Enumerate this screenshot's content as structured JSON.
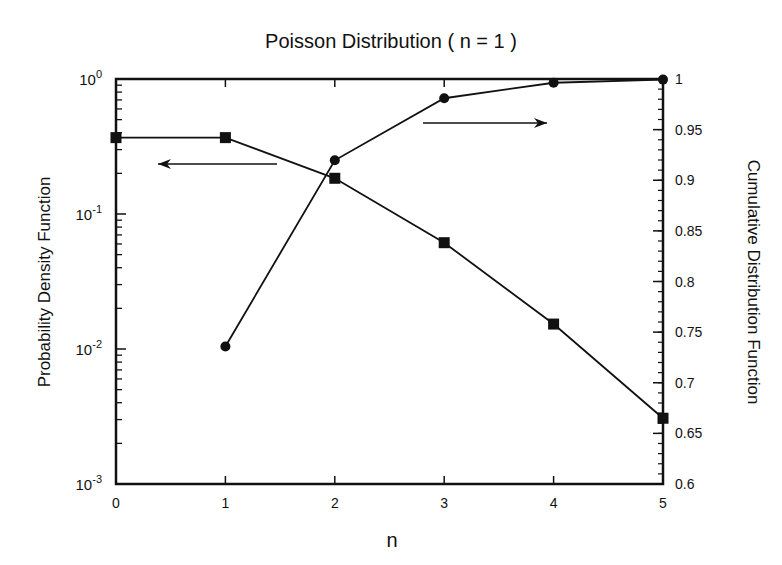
{
  "chart_data": {
    "type": "line",
    "title": "Poisson Distribution ( n = 1 )",
    "xlabel": "n",
    "ylabel_left": "Probability Density Function",
    "ylabel_right": "Cumulative Distribution Function",
    "x": [
      0,
      1,
      2,
      3,
      4,
      5
    ],
    "xlim": [
      0,
      5
    ],
    "x_ticks": [
      "0",
      "1",
      "2",
      "3",
      "4",
      "5"
    ],
    "ylim_left": [
      0.001,
      1
    ],
    "yscale_left": "log",
    "y_ticks_left": [
      {
        "base": "10",
        "exp": "0",
        "value": 1
      },
      {
        "base": "10",
        "exp": "-1",
        "value": 0.1
      },
      {
        "base": "10",
        "exp": "-2",
        "value": 0.01
      },
      {
        "base": "10",
        "exp": "-3",
        "value": 0.001
      }
    ],
    "ylim_right": [
      0.6,
      1
    ],
    "y_ticks_right": [
      "0.6",
      "0.65",
      "0.7",
      "0.75",
      "0.8",
      "0.85",
      "0.9",
      "0.95",
      "1"
    ],
    "grid": false,
    "series": [
      {
        "name": "Probability Density Function",
        "axis": "left",
        "marker": "square",
        "x": [
          0,
          1,
          2,
          3,
          4,
          5
        ],
        "values": [
          0.3679,
          0.3679,
          0.1839,
          0.0613,
          0.0153,
          0.00307
        ]
      },
      {
        "name": "Cumulative Distribution Function",
        "axis": "right",
        "marker": "circle",
        "x": [
          1,
          2,
          3,
          4,
          5
        ],
        "values": [
          0.7358,
          0.9197,
          0.981,
          0.9963,
          0.9994
        ]
      }
    ],
    "annotations": [
      {
        "type": "arrow",
        "direction": "left",
        "points_to": "left axis (PDF)"
      },
      {
        "type": "arrow",
        "direction": "right",
        "points_to": "right axis (CDF)"
      }
    ]
  },
  "layout": {
    "plot": {
      "left": 116,
      "top": 79,
      "right": 663,
      "bottom": 484
    },
    "arrow_left": {
      "x1": 277,
      "x2": 158,
      "y": 164
    },
    "arrow_right": {
      "x1": 423,
      "x2": 547,
      "y": 123
    }
  },
  "colors": {
    "ink": "#111111",
    "background": "#ffffff"
  }
}
